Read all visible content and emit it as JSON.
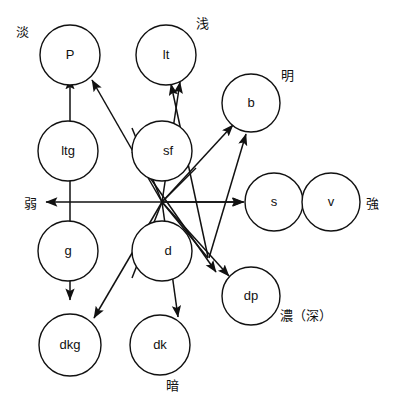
{
  "diagram": {
    "title_hidden": "",
    "nodes": [
      {
        "id": "P",
        "label": "P",
        "cx": 70,
        "cy": 55,
        "r": 30
      },
      {
        "id": "lt",
        "label": "lt",
        "cx": 166,
        "cy": 55,
        "r": 30
      },
      {
        "id": "b",
        "label": "b",
        "cx": 251,
        "cy": 103,
        "r": 29
      },
      {
        "id": "ltg",
        "label": "ltg",
        "cx": 68,
        "cy": 151,
        "r": 30
      },
      {
        "id": "sf",
        "label": "sf",
        "cx": 162,
        "cy": 151,
        "r": 30
      },
      {
        "id": "s",
        "label": "s",
        "cx": 274,
        "cy": 202,
        "r": 29
      },
      {
        "id": "v",
        "label": "v",
        "cx": 331,
        "cy": 202,
        "r": 29
      },
      {
        "id": "g",
        "label": "g",
        "cx": 68,
        "cy": 251,
        "r": 30
      },
      {
        "id": "d",
        "label": "d",
        "cx": 162,
        "cy": 251,
        "r": 30
      },
      {
        "id": "dp",
        "label": "dp",
        "cx": 251,
        "cy": 296,
        "r": 29
      },
      {
        "id": "dkg",
        "label": "dkg",
        "cx": 70,
        "cy": 345,
        "r": 31
      },
      {
        "id": "dk",
        "label": "dk",
        "cx": 160,
        "cy": 345,
        "r": 30
      }
    ],
    "axis_labels": [
      {
        "id": "pale",
        "text": "淡",
        "x": 16,
        "y": 22
      },
      {
        "id": "light",
        "text": "浅",
        "x": 196,
        "y": 14
      },
      {
        "id": "bright",
        "text": "明",
        "x": 281,
        "y": 66
      },
      {
        "id": "weak",
        "text": "弱",
        "x": 24,
        "y": 190
      },
      {
        "id": "strong",
        "text": "強",
        "x": 368,
        "y": 191
      },
      {
        "id": "deep",
        "text": "濃（深）",
        "x": 282,
        "y": 305
      },
      {
        "id": "dark",
        "text": "暗",
        "x": 167,
        "y": 374
      }
    ],
    "axes": [
      {
        "id": "vertical-axis",
        "from": [
          70,
          300
        ],
        "to": [
          70,
          78
        ],
        "arrow": "start-and-end"
      },
      {
        "id": "horizontal-axis",
        "from": [
          46,
          202
        ],
        "to": [
          244,
          202
        ],
        "arrow": "start-and-end"
      }
    ],
    "edges": [
      {
        "id": "hub-to-P",
        "from": "hub",
        "to": "P",
        "fromPt": [
          162,
          202
        ],
        "toPt": [
          92,
          80
        ]
      },
      {
        "id": "hub-to-lt",
        "from": "hub",
        "to": "lt",
        "fromPt": [
          162,
          202
        ],
        "toPt": [
          180,
          82
        ]
      },
      {
        "id": "hub-to-b",
        "from": "hub",
        "to": "b",
        "fromPt": [
          162,
          202
        ],
        "toPt": [
          233,
          125
        ]
      },
      {
        "id": "hub-to-s",
        "from": "hub",
        "to": "s",
        "fromPt": [
          162,
          202
        ],
        "toPt": [
          243,
          202
        ]
      },
      {
        "id": "hub-to-dp",
        "from": "hub",
        "to": "dp",
        "fromPt": [
          162,
          202
        ],
        "toPt": [
          229,
          276
        ]
      },
      {
        "id": "hub-to-dk",
        "from": "hub",
        "to": "dk",
        "fromPt": [
          162,
          202
        ],
        "toPt": [
          178,
          316
        ]
      },
      {
        "id": "hub-to-dkg",
        "from": "hub",
        "to": "dkg",
        "fromPt": [
          162,
          202
        ],
        "toPt": [
          94,
          317
        ]
      },
      {
        "id": "hub-to-b2",
        "from": "hub",
        "to": "b",
        "fromPt": [
          208,
          256
        ],
        "toPt": [
          245,
          134
        ]
      },
      {
        "id": "hub-to-lt2",
        "from": "hub",
        "to": "lt",
        "fromPt": [
          207,
          258
        ],
        "toPt": [
          171,
          84
        ]
      }
    ],
    "hub": {
      "x": 162,
      "y": 202
    }
  }
}
